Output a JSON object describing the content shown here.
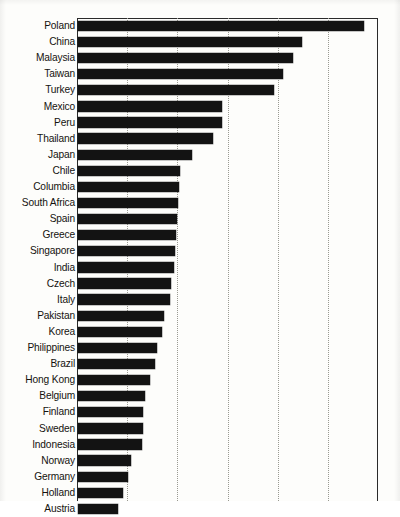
{
  "chart_data": {
    "type": "bar",
    "orientation": "horizontal",
    "title": "",
    "xlabel": "",
    "ylabel": "",
    "grid": true,
    "gridlines_x": [
      1,
      2,
      3,
      4,
      5
    ],
    "legend": null,
    "xlim": [
      0,
      6
    ],
    "axis_frame": "left-top-right",
    "categories": [
      "Poland",
      "China",
      "Malaysia",
      "Taiwan",
      "Turkey",
      "Mexico",
      "Peru",
      "Thailand",
      "Japan",
      "Chile",
      "Columbia",
      "South Africa",
      "Spain",
      "Greece",
      "Singapore",
      "India",
      "Czech",
      "Italy",
      "Pakistan",
      "Korea",
      "Philippines",
      "Brazil",
      "Hong Kong",
      "Belgium",
      "Finland",
      "Sweden",
      "Indonesia",
      "Norway",
      "Germany",
      "Holland",
      "Austria",
      "Denmark",
      "France",
      "Portugal",
      "New Zealand",
      "Australia"
    ],
    "values": [
      5.68,
      4.46,
      4.28,
      4.08,
      3.9,
      2.88,
      2.88,
      2.7,
      2.28,
      2.03,
      2.01,
      1.98,
      1.96,
      1.94,
      1.93,
      1.9,
      1.84,
      1.82,
      1.7,
      1.66,
      1.55,
      1.52,
      1.42,
      1.32,
      1.29,
      1.28,
      1.26,
      1.04,
      0.98,
      0.9,
      0.8,
      0.66,
      0.62,
      0.61,
      0.57,
      0.56
    ],
    "bar_end_px": [
      364,
      302,
      293,
      283,
      274,
      222,
      222,
      213,
      192,
      180,
      179,
      178,
      177,
      176,
      175,
      174,
      171,
      170,
      164,
      162,
      157,
      155,
      150,
      145,
      143,
      143,
      142,
      131,
      128,
      123,
      118,
      111,
      109,
      108,
      106,
      105
    ],
    "visible_rows": 30,
    "note_clipped": "Chart is cropped at bottom; lower rows partially visible"
  },
  "figure": {
    "plot_left_px": 77,
    "plot_top_px": 18,
    "plot_width_px": 301,
    "plot_height_px": 483,
    "bar_color": "#131313",
    "grid_color": "#9a9a92",
    "axis_color": "#2a2a2a",
    "background": "#fdfdfb"
  }
}
